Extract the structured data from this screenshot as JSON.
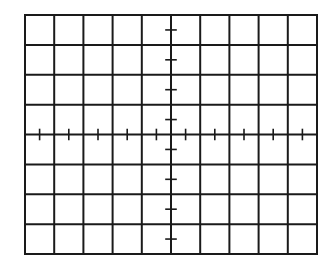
{
  "graticule": {
    "columns": 10,
    "rows": 8,
    "origin_x": 25,
    "origin_y": 15,
    "width": 292,
    "height": 239,
    "line_color": "#1a1a1a",
    "background": "#ffffff",
    "grid_stroke": 2,
    "tick_stroke": 1.6,
    "tick_half_length": 5,
    "tick_subdivision": 2,
    "center_axis_ticks": true
  }
}
